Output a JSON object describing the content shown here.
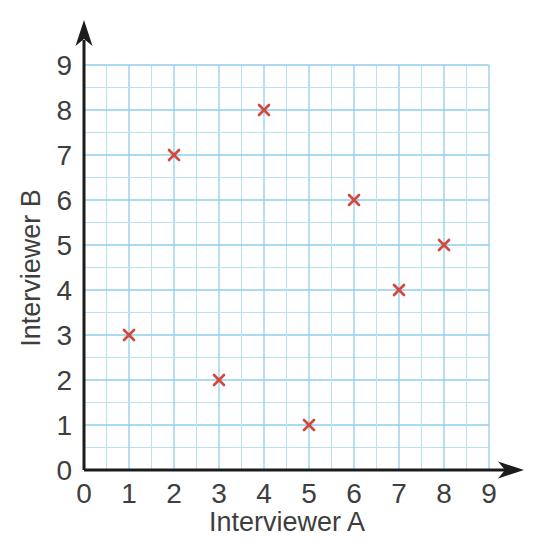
{
  "chart_data": {
    "type": "scatter",
    "title": "",
    "xlabel": "Interviewer A",
    "ylabel": "Interviewer B",
    "points": [
      [
        1,
        3
      ],
      [
        2,
        7
      ],
      [
        3,
        2
      ],
      [
        4,
        8
      ],
      [
        5,
        1
      ],
      [
        6,
        6
      ],
      [
        7,
        4
      ],
      [
        8,
        5
      ]
    ],
    "xlim": [
      0,
      9
    ],
    "ylim": [
      0,
      9
    ],
    "x_ticks": [
      "0",
      "1",
      "2",
      "3",
      "4",
      "5",
      "6",
      "7",
      "8",
      "9"
    ],
    "y_ticks": [
      "0",
      "1",
      "2",
      "3",
      "4",
      "5",
      "6",
      "7",
      "8",
      "9"
    ],
    "grid": "on",
    "grid_minor_step": 0.5,
    "grid_major_step": 1,
    "legend": "none",
    "marker": "x",
    "colors": {
      "marker": "#d1483d",
      "grid_minor": "#b9e2f4",
      "grid_major": "#8fceec",
      "axis": "#1c1c1c",
      "label": "#3e3e3e",
      "background": "#ffffff"
    }
  }
}
